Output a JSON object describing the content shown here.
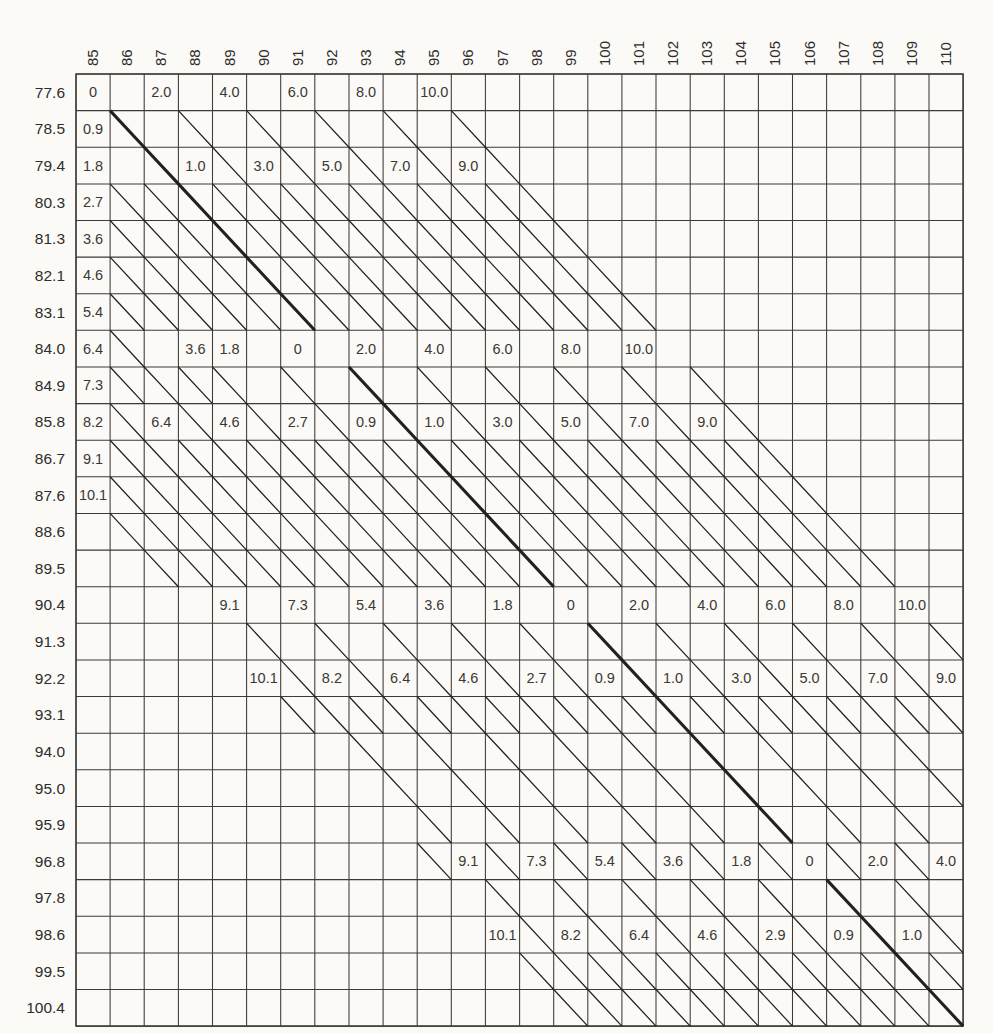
{
  "page": {
    "background": "#fbfaf7",
    "ink_color": "#22211f",
    "grid_color": "#3d3b38",
    "text_color": "#2e2d2b"
  },
  "chart_data": {
    "type": "table",
    "description_visible_text_only": "",
    "columns": [
      "85",
      "86",
      "87",
      "88",
      "89",
      "90",
      "91",
      "92",
      "93",
      "94",
      "95",
      "96",
      "97",
      "98",
      "99",
      "100",
      "101",
      "102",
      "103",
      "104",
      "105",
      "106",
      "107",
      "108",
      "109",
      "110"
    ],
    "rows": [
      "77.6",
      "78.5",
      "79.4",
      "80.3",
      "81.3",
      "82.1",
      "83.1",
      "84.0",
      "84.9",
      "85.8",
      "86.7",
      "87.6",
      "88.6",
      "89.5",
      "90.4",
      "91.3",
      "92.2",
      "93.1",
      "94.0",
      "95.0",
      "95.9",
      "96.8",
      "97.8",
      "98.6",
      "99.5",
      "100.4"
    ],
    "cell_labels": [
      [
        0,
        0,
        "0"
      ],
      [
        0,
        2,
        "2.0"
      ],
      [
        0,
        4,
        "4.0"
      ],
      [
        0,
        6,
        "6.0"
      ],
      [
        0,
        8,
        "8.0"
      ],
      [
        0,
        10,
        "10.0"
      ],
      [
        1,
        0,
        "0.9"
      ],
      [
        2,
        0,
        "1.8"
      ],
      [
        3,
        0,
        "2.7"
      ],
      [
        4,
        0,
        "3.6"
      ],
      [
        5,
        0,
        "4.6"
      ],
      [
        6,
        0,
        "5.4"
      ],
      [
        7,
        0,
        "6.4"
      ],
      [
        8,
        0,
        "7.3"
      ],
      [
        9,
        0,
        "8.2"
      ],
      [
        10,
        0,
        "9.1"
      ],
      [
        11,
        0,
        "10.1"
      ],
      [
        2,
        3,
        "1.0"
      ],
      [
        2,
        5,
        "3.0"
      ],
      [
        2,
        7,
        "5.0"
      ],
      [
        2,
        9,
        "7.0"
      ],
      [
        2,
        11,
        "9.0"
      ],
      [
        7,
        3,
        "3.6"
      ],
      [
        7,
        4,
        "1.8"
      ],
      [
        7,
        6,
        "0"
      ],
      [
        7,
        8,
        "2.0"
      ],
      [
        7,
        10,
        "4.0"
      ],
      [
        7,
        12,
        "6.0"
      ],
      [
        7,
        14,
        "8.0"
      ],
      [
        7,
        16,
        "10.0"
      ],
      [
        9,
        2,
        "6.4"
      ],
      [
        9,
        4,
        "4.6"
      ],
      [
        9,
        6,
        "2.7"
      ],
      [
        9,
        8,
        "0.9"
      ],
      [
        9,
        10,
        "1.0"
      ],
      [
        9,
        12,
        "3.0"
      ],
      [
        9,
        14,
        "5.0"
      ],
      [
        9,
        16,
        "7.0"
      ],
      [
        9,
        18,
        "9.0"
      ],
      [
        14,
        4,
        "9.1"
      ],
      [
        14,
        6,
        "7.3"
      ],
      [
        14,
        8,
        "5.4"
      ],
      [
        14,
        10,
        "3.6"
      ],
      [
        14,
        12,
        "1.8"
      ],
      [
        14,
        14,
        "0"
      ],
      [
        14,
        16,
        "2.0"
      ],
      [
        14,
        18,
        "4.0"
      ],
      [
        14,
        20,
        "6.0"
      ],
      [
        14,
        22,
        "8.0"
      ],
      [
        14,
        24,
        "10.0"
      ],
      [
        16,
        5,
        "10.1"
      ],
      [
        16,
        7,
        "8.2"
      ],
      [
        16,
        9,
        "6.4"
      ],
      [
        16,
        11,
        "4.6"
      ],
      [
        16,
        13,
        "2.7"
      ],
      [
        16,
        15,
        "0.9"
      ],
      [
        16,
        17,
        "1.0"
      ],
      [
        16,
        19,
        "3.0"
      ],
      [
        16,
        21,
        "5.0"
      ],
      [
        16,
        23,
        "7.0"
      ],
      [
        16,
        25,
        "9.0"
      ],
      [
        21,
        11,
        "9.1"
      ],
      [
        21,
        13,
        "7.3"
      ],
      [
        21,
        15,
        "5.4"
      ],
      [
        21,
        17,
        "3.6"
      ],
      [
        21,
        19,
        "1.8"
      ],
      [
        21,
        21,
        "0"
      ],
      [
        21,
        23,
        "2.0"
      ],
      [
        21,
        25,
        "4.0"
      ],
      [
        23,
        12,
        "10.1"
      ],
      [
        23,
        14,
        "8.2"
      ],
      [
        23,
        16,
        "6.4"
      ],
      [
        23,
        18,
        "4.6"
      ],
      [
        23,
        20,
        "2.9"
      ],
      [
        23,
        22,
        "0.9"
      ],
      [
        23,
        24,
        "1.0"
      ]
    ],
    "diagonals": {
      "slope_cells_per_column": 1,
      "d_min": -11,
      "d_max": 10,
      "thick_d": 0,
      "values_by_d": {
        "-11": "10.1",
        "-10": "9.1",
        "-9": "8.2",
        "-8": "7.3",
        "-7": "6.4",
        "-6": "5.4",
        "-5": "4.6",
        "-4": "3.6",
        "-3": "2.7",
        "-2": "1.8",
        "-1": "0.9",
        "0": "0",
        "1": "1.0",
        "2": "2.0",
        "3": "3.0",
        "4": "4.0",
        "5": "5.0",
        "6": "6.0",
        "7": "7.0",
        "8": "8.0",
        "9": "9.0",
        "10": "10.0"
      },
      "even_gap_rows": [
        0,
        7,
        14,
        21
      ],
      "odd_suppressed_rows": [
        7,
        8,
        14,
        15,
        18,
        19,
        20,
        22
      ],
      "keep_exception_cells": [
        [
          7,
          1
        ],
        [
          8,
          1
        ],
        [
          8,
          3
        ]
      ],
      "extra_skip_cells": [
        [
          2,
          1
        ]
      ]
    },
    "legend_position": "none",
    "grid_on": true
  }
}
